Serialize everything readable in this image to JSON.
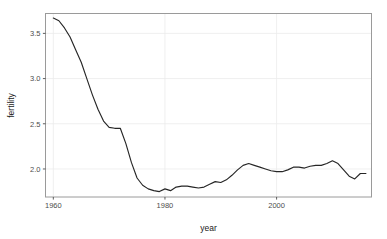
{
  "chart_data": {
    "type": "line",
    "title": "",
    "subtitle": "",
    "xlabel": "year",
    "ylabel": "fertility",
    "xlim": [
      1958.6,
      2017.0
    ],
    "ylim": [
      1.69,
      3.72
    ],
    "grid": true,
    "legend": null,
    "legend_position": "none",
    "xticks": [
      1960,
      1980,
      2000
    ],
    "xtick_labels": [
      "1960",
      "1980",
      "2000"
    ],
    "yticks": [
      2.0,
      2.5,
      3.0,
      3.5
    ],
    "ytick_labels": [
      "2.0",
      "2.5",
      "3.0",
      "3.5"
    ],
    "line_color": "#262626",
    "panel_border_color": "#9a9a9a",
    "grid_color": "#ebebeb",
    "series": [
      {
        "name": "fertility",
        "x": [
          1960,
          1961,
          1962,
          1963,
          1964,
          1965,
          1966,
          1967,
          1968,
          1969,
          1970,
          1971,
          1972,
          1973,
          1974,
          1975,
          1976,
          1977,
          1978,
          1979,
          1980,
          1981,
          1982,
          1983,
          1984,
          1985,
          1986,
          1987,
          1988,
          1989,
          1990,
          1991,
          1992,
          1993,
          1994,
          1995,
          1996,
          1997,
          1998,
          1999,
          2000,
          2001,
          2002,
          2003,
          2004,
          2005,
          2006,
          2007,
          2008,
          2009,
          2010,
          2011,
          2012,
          2013,
          2014,
          2015,
          2016
        ],
        "y": [
          3.67,
          3.64,
          3.56,
          3.46,
          3.32,
          3.18,
          3.0,
          2.82,
          2.66,
          2.53,
          2.46,
          2.45,
          2.45,
          2.28,
          2.07,
          1.9,
          1.82,
          1.78,
          1.76,
          1.75,
          1.78,
          1.76,
          1.8,
          1.81,
          1.81,
          1.8,
          1.79,
          1.8,
          1.83,
          1.86,
          1.85,
          1.88,
          1.93,
          1.99,
          2.04,
          2.06,
          2.04,
          2.02,
          2.0,
          1.98,
          1.97,
          1.97,
          1.99,
          2.02,
          2.02,
          2.01,
          2.03,
          2.04,
          2.04,
          2.06,
          2.09,
          2.06,
          1.99,
          1.92,
          1.89,
          1.95,
          1.95
        ]
      }
    ]
  },
  "axis": {
    "y_title": "fertility",
    "x_title": "year"
  }
}
